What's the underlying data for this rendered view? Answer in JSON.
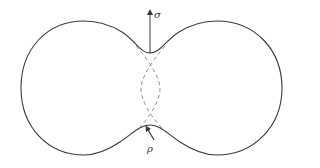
{
  "diagram": {
    "type": "sintering-neck-two-particles",
    "labels": {
      "sigma": "σ",
      "rho": "ρ"
    },
    "colors": {
      "outline": "#3a3a3a",
      "dashed": "#8a8a8a",
      "arrow": "#3a3a3a",
      "text": "#333333",
      "background": "#ffffff"
    },
    "arrows": [
      {
        "name": "sigma-arrow",
        "meaning": "surface tension / stress direction",
        "label": "σ"
      },
      {
        "name": "rho-arrow",
        "meaning": "neck curvature radius",
        "label": "ρ"
      }
    ]
  }
}
